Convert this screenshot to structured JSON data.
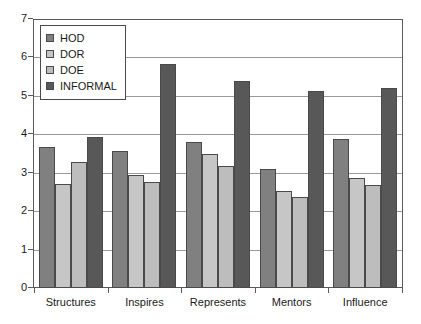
{
  "chart_data": {
    "type": "bar",
    "title": "",
    "subtitle": "",
    "xlabel": "",
    "ylabel": "",
    "ylim": [
      0,
      7
    ],
    "ytick_labels": [
      "0",
      "1",
      "2",
      "3",
      "4",
      "5",
      "6",
      "7"
    ],
    "ytick_values": [
      0,
      1,
      2,
      3,
      4,
      5,
      6,
      7
    ],
    "grid": "horizontal",
    "legend_position": "top-left-inside",
    "categories": [
      "Structures",
      "Inspires",
      "Represents",
      "Mentors",
      "Influence"
    ],
    "series": [
      {
        "name": "HOD",
        "color": "#808080",
        "values": [
          3.67,
          3.57,
          3.79,
          3.11,
          3.89
        ]
      },
      {
        "name": "DOR",
        "color": "#c6c6c6",
        "values": [
          2.71,
          2.95,
          3.5,
          2.52,
          2.87
        ]
      },
      {
        "name": "DOE",
        "color": "#bdbdbd",
        "values": [
          3.27,
          2.75,
          3.18,
          2.37,
          2.68
        ]
      },
      {
        "name": "INFORMAL",
        "color": "#585858",
        "values": [
          3.94,
          5.82,
          5.4,
          5.12,
          5.2
        ]
      }
    ],
    "colors": {
      "axis": "#5a5a5a",
      "gridline": "#9a9a9a",
      "bar_outline": "#4a4a4a",
      "text": "#1a1a1a",
      "background": "#ffffff"
    }
  }
}
